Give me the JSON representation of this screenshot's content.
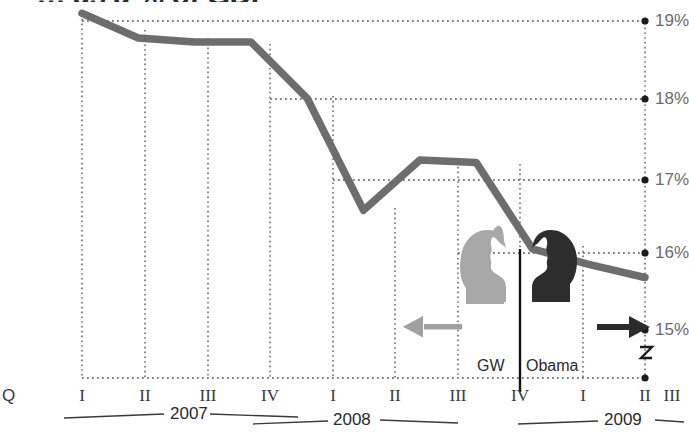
{
  "title": "… as a % of GDP",
  "chart_data": {
    "type": "line",
    "title": "… as a % of GDP",
    "xlabel": "",
    "ylabel": "%",
    "ylim": [
      14.6,
      19.35
    ],
    "grid": true,
    "legend_position": "inline-annotation",
    "y_tick_labels": [
      "19%",
      "18%",
      "17%",
      "16%",
      "15%"
    ],
    "y_ticks": [
      19,
      18,
      17,
      16,
      15
    ],
    "axis_break": "zigzag below 15%",
    "x_quarter_labels": [
      "I",
      "II",
      "III",
      "IV",
      "I",
      "II",
      "III",
      "IV",
      "I",
      "II",
      "III"
    ],
    "x_quarter_prefix": "Q",
    "x_year_groups": [
      {
        "label": "2007",
        "quarters": [
          "I",
          "II",
          "III",
          "IV"
        ]
      },
      {
        "label": "2008",
        "quarters": [
          "I",
          "II",
          "III",
          "IV"
        ]
      },
      {
        "label": "2009",
        "quarters": [
          "I",
          "II",
          "III"
        ]
      }
    ],
    "x": [
      "2007 Q1",
      "2007 Q2",
      "2007 Q3",
      "2007 Q4",
      "2008 Q1",
      "2008 Q2",
      "2008 Q3",
      "2008 Q4",
      "2009 Q1",
      "2009 Q2",
      "2009 Q3"
    ],
    "series": [
      {
        "name": "Revenue as a % of GDP",
        "values": [
          19.1,
          18.78,
          18.73,
          18.73,
          18.0,
          16.55,
          17.2,
          17.17,
          16.05,
          15.85,
          15.68
        ]
      }
    ],
    "annotations": [
      {
        "name": "administration-divider",
        "at": "2009 Q1",
        "style": "solid vertical black line"
      },
      {
        "name": "gw-label",
        "text": "GW",
        "arrow": "left",
        "color": "#9a9a9a"
      },
      {
        "name": "obama-label",
        "text": "Obama",
        "arrow": "right",
        "color": "#2b2b2b"
      }
    ]
  },
  "annotations": {
    "gw_label": "GW",
    "obama_label": "Obama"
  },
  "colors": {
    "line": "#6d6d6d",
    "grid": "#555555",
    "gw": "#a8a8a8",
    "obama": "#2d2d2d",
    "tick_label": "#6b6b6b"
  },
  "icons": {
    "left_arrow": "left-arrow-icon",
    "right_arrow": "right-arrow-icon",
    "gw_head": "gw-head-silhouette-icon",
    "obama_head": "obama-head-silhouette-icon",
    "axis_break": "axis-break-zigzag-icon"
  }
}
